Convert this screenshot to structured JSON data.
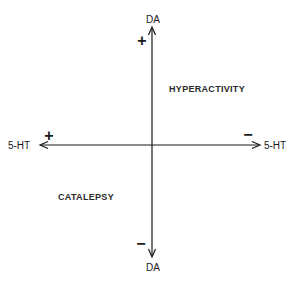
{
  "diagram": {
    "axes": {
      "vertical": {
        "top_label": "DA",
        "bottom_label": "DA",
        "top_sign": "+",
        "bottom_sign": "−"
      },
      "horizontal": {
        "left_label": "5-HT",
        "right_label": "5-HT",
        "left_sign": "+",
        "right_sign": "−"
      }
    },
    "quadrants": {
      "upper_right": "HYPERACTIVITY",
      "lower_left": "CATALEPSY"
    },
    "colors": {
      "ink": "#1a1a1a",
      "background": "#ffffff"
    }
  }
}
